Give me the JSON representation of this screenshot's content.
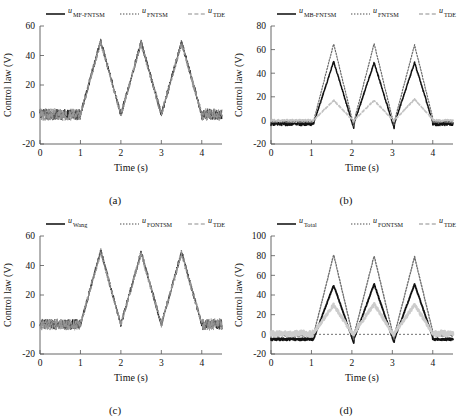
{
  "figure": {
    "axis_titles": {
      "x": "Time (s)",
      "y": "Control law (V)"
    }
  },
  "panels": [
    {
      "caption": "(a)",
      "legend": [
        {
          "symbol": "u",
          "sub": "MF-FNTSM",
          "style": "solid",
          "color": "#1a1a1a"
        },
        {
          "symbol": "u",
          "sub": "FNTSM",
          "style": "dotted",
          "color": "#4d4d4d"
        },
        {
          "symbol": "u",
          "sub": "TDE",
          "style": "dashed",
          "color": "#8c8c8c"
        }
      ],
      "chart_data": {
        "type": "line",
        "title": "",
        "xlabel": "Time (s)",
        "ylabel": "Control law (V)",
        "xlim": [
          0,
          4.5
        ],
        "ylim": [
          -20,
          60
        ],
        "xticks": [
          0,
          1,
          2,
          3,
          4
        ],
        "yticks": [
          -20,
          0,
          20,
          40,
          60
        ],
        "grid": false,
        "zero_reference": false,
        "series": [
          {
            "name": "u_MF-FNTSM",
            "color": "#1a1a1a",
            "style": "solid",
            "width": 0.9,
            "shape": "triangular-burst",
            "baseline": 0,
            "noise": 3.6,
            "burst_start": 1.0,
            "burst_end": 4.0,
            "period": 1.0,
            "peak": 50,
            "peak_values": [
              50,
              49,
              49
            ],
            "band": 0
          },
          {
            "name": "u_FNTSM",
            "color": "#595959",
            "style": "dotted",
            "width": 0.9,
            "shape": "triangular-burst",
            "baseline": 0,
            "noise": 4.0,
            "burst_start": 1.0,
            "burst_end": 4.0,
            "period": 1.0,
            "peak": 50,
            "peak_values": [
              50,
              49,
              49
            ],
            "band": 0
          },
          {
            "name": "u_TDE",
            "color": "#9a9a9a",
            "style": "dashed",
            "width": 0.9,
            "shape": "triangular-burst",
            "baseline": 0,
            "noise": 4.2,
            "burst_start": 1.0,
            "burst_end": 4.0,
            "period": 1.0,
            "peak": 49,
            "peak_values": [
              49,
              48,
              48
            ],
            "band": 0
          }
        ]
      }
    },
    {
      "caption": "(b)",
      "legend": [
        {
          "symbol": "u",
          "sub": "MB-FNTSM",
          "style": "solid",
          "color": "#1a1a1a"
        },
        {
          "symbol": "u",
          "sub": "FNTSM",
          "style": "dotted",
          "color": "#4d4d4d"
        },
        {
          "symbol": "u",
          "sub": "TDE",
          "style": "dashed",
          "color": "#8c8c8c"
        }
      ],
      "chart_data": {
        "type": "line",
        "title": "",
        "xlabel": "Time (s)",
        "ylabel": "Control law (V)",
        "xlim": [
          0,
          4.5
        ],
        "ylim": [
          -20,
          80
        ],
        "xticks": [
          0,
          1,
          2,
          3,
          4
        ],
        "yticks": [
          -20,
          0,
          20,
          40,
          60,
          80
        ],
        "grid": false,
        "zero_reference": false,
        "series": [
          {
            "name": "u_MB-FNTSM",
            "color": "#111111",
            "style": "solid",
            "width": 1.5,
            "shape": "triangular-burst",
            "baseline": -3,
            "noise": 1.4,
            "burst_start": 1.05,
            "burst_end": 4.0,
            "period": 1.0,
            "peak": 50,
            "peak_values": [
              50,
              49,
              49
            ],
            "trough": -7,
            "band": 0
          },
          {
            "name": "u_FNTSM",
            "color": "#6b6b6b",
            "style": "dotted",
            "width": 1.2,
            "shape": "triangular-burst",
            "baseline": -1,
            "noise": 1.0,
            "burst_start": 1.05,
            "burst_end": 4.0,
            "period": 1.0,
            "peak": 65,
            "peak_values": [
              65,
              65,
              64
            ],
            "trough": -5,
            "band": 0
          },
          {
            "name": "u_TDE",
            "color": "#c2c2c2",
            "style": "dashed",
            "width": 1.6,
            "shape": "triangular-burst",
            "baseline": 0,
            "noise": 0.8,
            "burst_start": 1.05,
            "burst_end": 4.0,
            "period": 1.0,
            "peak": 17,
            "peak_values": [
              17,
              17,
              18
            ],
            "trough": -1,
            "band": 0
          }
        ]
      }
    },
    {
      "caption": "(c)",
      "legend": [
        {
          "symbol": "u",
          "sub": "Wang",
          "style": "solid",
          "color": "#1a1a1a"
        },
        {
          "symbol": "u",
          "sub": "FONTSM",
          "style": "dotted",
          "color": "#4d4d4d"
        },
        {
          "symbol": "u",
          "sub": "TDE",
          "style": "dashed",
          "color": "#8c8c8c"
        }
      ],
      "chart_data": {
        "type": "line",
        "title": "",
        "xlabel": "Time (s)",
        "ylabel": "Control law (V)",
        "xlim": [
          0,
          4.5
        ],
        "ylim": [
          -20,
          60
        ],
        "xticks": [
          0,
          1,
          2,
          3,
          4
        ],
        "yticks": [
          -20,
          0,
          20,
          40,
          60
        ],
        "grid": false,
        "zero_reference": false,
        "series": [
          {
            "name": "u_Wang",
            "color": "#1a1a1a",
            "style": "solid",
            "width": 0.9,
            "shape": "triangular-burst",
            "baseline": 0,
            "noise": 3.4,
            "burst_start": 1.0,
            "burst_end": 4.0,
            "period": 1.0,
            "peak": 50,
            "peak_values": [
              50,
              49,
              49
            ],
            "band": 0
          },
          {
            "name": "u_FONTSM",
            "color": "#595959",
            "style": "dotted",
            "width": 0.9,
            "shape": "triangular-burst",
            "baseline": 0,
            "noise": 3.8,
            "burst_start": 1.0,
            "burst_end": 4.0,
            "period": 1.0,
            "peak": 50,
            "peak_values": [
              50,
              49,
              49
            ],
            "band": 0
          },
          {
            "name": "u_TDE",
            "color": "#9a9a9a",
            "style": "dashed",
            "width": 0.9,
            "shape": "triangular-burst",
            "baseline": 0,
            "noise": 4.0,
            "burst_start": 1.0,
            "burst_end": 4.0,
            "period": 1.0,
            "peak": 49,
            "peak_values": [
              49,
              48,
              48
            ],
            "band": 0
          }
        ]
      }
    },
    {
      "caption": "(d)",
      "legend": [
        {
          "symbol": "u",
          "sub": "Total",
          "style": "solid",
          "color": "#1a1a1a"
        },
        {
          "symbol": "u",
          "sub": "FONTSM",
          "style": "dotted",
          "color": "#4d4d4d"
        },
        {
          "symbol": "u",
          "sub": "TDE",
          "style": "dashed",
          "color": "#8c8c8c"
        }
      ],
      "chart_data": {
        "type": "line",
        "title": "",
        "xlabel": "Time (s)",
        "ylabel": "Control law (V)",
        "xlim": [
          0,
          4.5
        ],
        "ylim": [
          -20,
          100
        ],
        "xticks": [
          0,
          1,
          2,
          3,
          4
        ],
        "yticks": [
          -20,
          0,
          20,
          40,
          60,
          80,
          100
        ],
        "grid": false,
        "zero_reference": true,
        "series": [
          {
            "name": "u_Total",
            "color": "#111111",
            "style": "solid",
            "width": 1.8,
            "shape": "triangular-burst",
            "baseline": -5,
            "noise": 1.2,
            "burst_start": 1.05,
            "burst_end": 4.0,
            "period": 1.0,
            "peak": 50,
            "peak_values": [
              50,
              51,
              51
            ],
            "trough": -9,
            "band": 0
          },
          {
            "name": "u_FONTSM",
            "color": "#707070",
            "style": "dotted",
            "width": 1.4,
            "shape": "triangular-burst",
            "baseline": -1,
            "noise": 1.0,
            "burst_start": 1.05,
            "burst_end": 4.0,
            "period": 1.0,
            "peak": 80,
            "peak_values": [
              81,
              80,
              79
            ],
            "trough": -6,
            "band": 0
          },
          {
            "name": "u_TDE",
            "color": "#cccccc",
            "style": "dashed",
            "width": 2.6,
            "shape": "triangular-burst",
            "baseline": 1,
            "noise": 2.6,
            "burst_start": 1.05,
            "burst_end": 4.0,
            "period": 1.0,
            "peak": 30,
            "peak_values": [
              30,
              31,
              30
            ],
            "trough": -2,
            "band": 0
          }
        ]
      }
    }
  ]
}
